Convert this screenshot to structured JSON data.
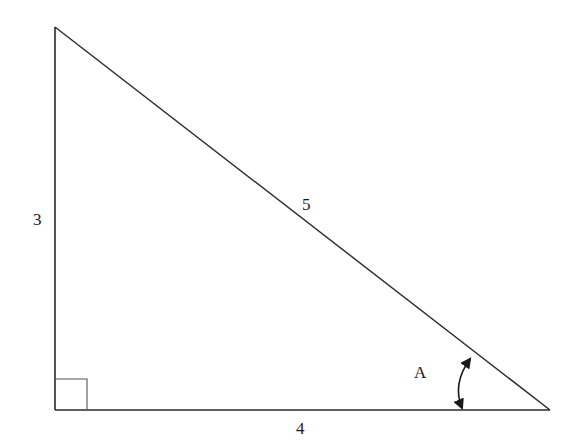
{
  "diagram": {
    "type": "right-triangle",
    "sides": {
      "vertical_leg": "3",
      "horizontal_leg": "4",
      "hypotenuse": "5"
    },
    "angle_label": "A",
    "right_angle_marker": true,
    "colors": {
      "stroke": "#2a2a2a",
      "background": "#ffffff"
    }
  }
}
